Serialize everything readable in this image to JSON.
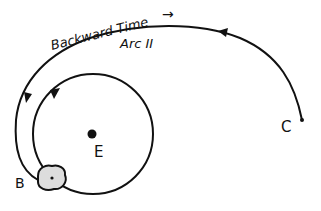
{
  "diagram": {
    "labels": {
      "backward_time": "Backward Time",
      "arc": "Arc II",
      "earth": "E",
      "point_b": "B",
      "point_c": "C"
    },
    "arrow_glyph": "→",
    "colors": {
      "ink": "#111111",
      "background": "#ffffff"
    }
  }
}
